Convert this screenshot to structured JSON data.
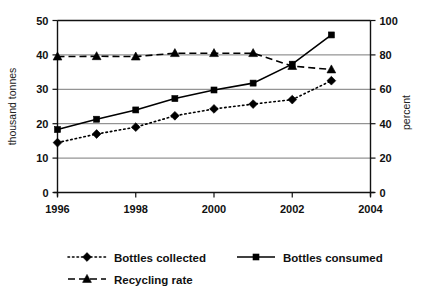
{
  "chart_data": {
    "type": "line",
    "title": "",
    "subtitle": "",
    "x": [
      1996,
      1997,
      1998,
      1999,
      2000,
      2001,
      2002,
      2003
    ],
    "xlabel": "",
    "xticks": [
      "1996",
      "1998",
      "2000",
      "2002",
      "2004"
    ],
    "xtick_values": [
      1996,
      1998,
      2000,
      2002,
      2004
    ],
    "xlim": [
      1996,
      2004
    ],
    "grid": true,
    "legend_position": "bottom-left",
    "axes": [
      {
        "id": "left",
        "ylabel": "thousand tonnes",
        "ylim": [
          0,
          50
        ],
        "yticks": [
          "0",
          "10",
          "20",
          "30",
          "40",
          "50"
        ],
        "ytick_values": [
          0,
          10,
          20,
          30,
          40,
          50
        ]
      },
      {
        "id": "right",
        "ylabel": "percent",
        "ylim": [
          0,
          100
        ],
        "yticks": [
          "0",
          "20",
          "40",
          "60",
          "80",
          "100"
        ],
        "ytick_values": [
          0,
          20,
          40,
          60,
          80,
          100
        ]
      }
    ],
    "series": [
      {
        "name": "Bottles collected",
        "axis": "left",
        "marker": "diamond",
        "linestyle": "dotted",
        "values": [
          14.5,
          17.0,
          19.0,
          22.3,
          24.3,
          25.7,
          27.0,
          32.5
        ]
      },
      {
        "name": "Bottles consumed",
        "axis": "left",
        "marker": "square",
        "linestyle": "solid",
        "values": [
          18.3,
          21.3,
          24.0,
          27.3,
          29.8,
          31.8,
          37.3,
          45.8
        ]
      },
      {
        "name": "Recycling rate",
        "axis": "right",
        "marker": "triangle",
        "linestyle": "dashed",
        "values": [
          79.0,
          79.2,
          79.0,
          81.0,
          81.0,
          81.0,
          73.5,
          71.5
        ]
      }
    ]
  },
  "legend": {
    "items": [
      {
        "label": "Bottles collected",
        "marker": "diamond",
        "linestyle": "dotted"
      },
      {
        "label": "Bottles consumed",
        "marker": "square",
        "linestyle": "solid"
      },
      {
        "label": "Recycling rate",
        "marker": "triangle",
        "linestyle": "dashed"
      }
    ]
  }
}
